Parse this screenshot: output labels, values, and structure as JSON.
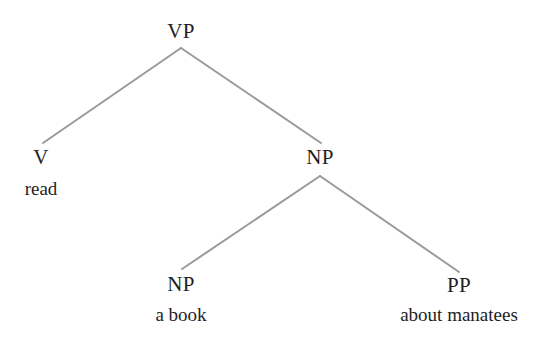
{
  "diagram": {
    "type": "syntax-tree",
    "line_color": "#9a9a9a",
    "text_color": "#1e1e1e",
    "nodes": {
      "vp": {
        "category": "VP",
        "word": null,
        "x": 181,
        "y": 22
      },
      "v": {
        "category": "V",
        "word": "read",
        "x": 41,
        "y": 147
      },
      "np_main": {
        "category": "NP",
        "word": null,
        "x": 320,
        "y": 148
      },
      "np_book": {
        "category": "NP",
        "word": "a book",
        "x": 181,
        "y": 275
      },
      "pp": {
        "category": "PP",
        "word": "about manatees",
        "x": 459,
        "y": 276
      }
    },
    "edges": [
      {
        "from": "vp",
        "to": "v",
        "x1": 181,
        "y1": 48,
        "x2": 43,
        "y2": 143
      },
      {
        "from": "vp",
        "to": "np_main",
        "x1": 181,
        "y1": 48,
        "x2": 321,
        "y2": 143
      },
      {
        "from": "np_main",
        "to": "np_book",
        "x1": 320,
        "y1": 176,
        "x2": 182,
        "y2": 269
      },
      {
        "from": "np_main",
        "to": "pp",
        "x1": 320,
        "y1": 176,
        "x2": 459,
        "y2": 272
      }
    ]
  }
}
